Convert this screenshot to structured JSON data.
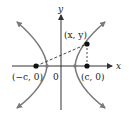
{
  "diagram": {
    "type": "hyperbola-definition",
    "axes": {
      "x_label": "x",
      "y_label": "y",
      "origin_label": "0"
    },
    "points": {
      "left_focus": "(−c, 0)",
      "right_focus": "(c, 0)",
      "curve_point": "(x, y)"
    },
    "colors": {
      "curve": "#7a7a7a",
      "axis": "#333333",
      "point": "#111111",
      "dashed": "#333333"
    }
  }
}
